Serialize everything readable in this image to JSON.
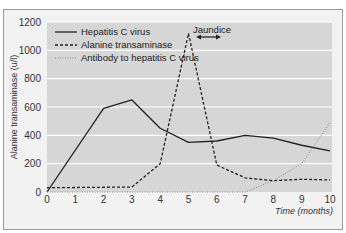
{
  "chart_data": {
    "type": "line",
    "title": "",
    "xlabel": "Time (months)",
    "ylabel": "Alanine transaminase (u/l)",
    "xlim": [
      0,
      10
    ],
    "ylim": [
      0,
      1200
    ],
    "x_ticks": [
      "0",
      "1",
      "2",
      "3",
      "4",
      "5",
      "6",
      "7",
      "8",
      "9",
      "10"
    ],
    "y_ticks": [
      "0",
      "200",
      "400",
      "600",
      "800",
      "1000",
      "1200"
    ],
    "grid": true,
    "legend_position": "upper-left",
    "annotations": [
      {
        "text": "Jaundice",
        "x_range": [
          5.2,
          6.1
        ],
        "arrow": "double-headed"
      }
    ],
    "series": [
      {
        "name": "Hepatitis C virus",
        "style": "solid",
        "x": [
          0,
          2,
          3,
          4,
          5,
          6,
          7,
          8,
          9,
          10
        ],
        "y": [
          0,
          590,
          650,
          450,
          350,
          360,
          400,
          380,
          330,
          290
        ]
      },
      {
        "name": "Alanine transaminase",
        "style": "dashed",
        "x": [
          0,
          3,
          4,
          5,
          6,
          7,
          8,
          9,
          10
        ],
        "y": [
          30,
          35,
          200,
          1120,
          190,
          100,
          80,
          90,
          85
        ]
      },
      {
        "name": "Antibody to hepatitis C virus",
        "style": "dotted",
        "x": [
          0,
          7,
          8,
          9,
          10
        ],
        "y": [
          0,
          0,
          80,
          200,
          490
        ]
      }
    ]
  },
  "labels": {
    "ylabel": "Alanine transaminase (u/l)",
    "xlabel": "Time (months)",
    "jaundice": "Jaundice",
    "legend": [
      "Hepatitis C virus",
      "Alanine transaminase",
      "Antibody to hepatitis C virus"
    ]
  },
  "colors": {
    "plot_bg": "#d6d6d6",
    "frame_bg": "#f2f2f2",
    "grid": "#ffffff",
    "line": "#222222",
    "dotted": "#8a8a8a"
  }
}
